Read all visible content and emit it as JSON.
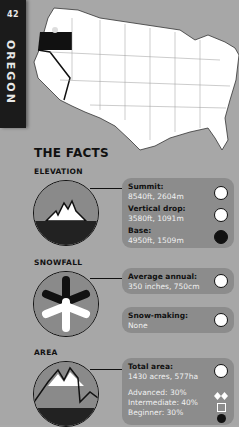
{
  "page": {
    "number": "42",
    "state": "OREGON"
  },
  "map": {
    "highlighted_state": "Oregon",
    "highlight_color": "#111111",
    "map_color": "#ffffff",
    "background": "#a7a7a7"
  },
  "facts_title": "THE FACTS",
  "sections": {
    "elevation": {
      "label": "ELEVATION",
      "items": [
        {
          "key": "Summit:",
          "value": "8540ft, 2604m",
          "icon": "summit-icon"
        },
        {
          "key": "Vertical drop:",
          "value": "3580ft, 1091m",
          "icon": "vertical-drop-icon"
        },
        {
          "key": "Base:",
          "value": "4950ft, 1509m",
          "icon": "base-icon"
        }
      ]
    },
    "snowfall": {
      "label": "SNOWFALL",
      "items": [
        {
          "key": "Average annual:",
          "value": "350 inches, 750cm",
          "icon": "snow-depth-icon"
        },
        {
          "key": "Snow-making:",
          "value": "None",
          "icon": "snowflake-icon"
        }
      ]
    },
    "area": {
      "label": "AREA",
      "total": {
        "key": "Total area:",
        "value": "1430 acres, 577ha",
        "icon": "total-area-icon"
      },
      "runs": [
        {
          "label": "Advanced: 30%",
          "icon": "double-diamond-icon"
        },
        {
          "label": "Intermediate: 40%",
          "icon": "square-icon"
        },
        {
          "label": "Beginner: 30%",
          "icon": "circle-icon"
        }
      ]
    }
  }
}
